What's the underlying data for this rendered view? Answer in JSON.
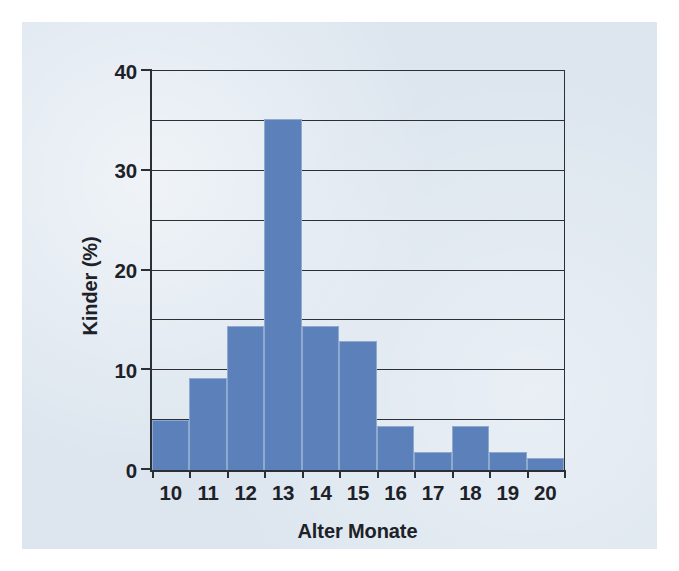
{
  "figure": {
    "background_color": "#ffffff",
    "panel_color": "#dde6ef",
    "bar_fill_color": "#5c80b9",
    "bar_edge_color": "#8fa9d0",
    "axis_color": "#2b2f36"
  },
  "chart_data": {
    "type": "bar",
    "title": "",
    "subtitle": "",
    "xlabel": "Alter Monate",
    "ylabel": "Kinder (%)",
    "categories": [
      "10",
      "11",
      "12",
      "13",
      "14",
      "15",
      "16",
      "17",
      "18",
      "19",
      "20"
    ],
    "values": [
      5.0,
      9.2,
      14.4,
      35.2,
      14.4,
      12.9,
      4.4,
      1.8,
      4.4,
      1.8,
      1.2
    ],
    "series": [
      {
        "name": "Kinder (%)",
        "values": [
          5.0,
          9.2,
          14.4,
          35.2,
          14.4,
          12.9,
          4.4,
          1.8,
          4.4,
          1.8,
          1.2
        ]
      }
    ],
    "xlim": [
      9.5,
      20.5
    ],
    "ylim": [
      0,
      40
    ],
    "ytick_labels": [
      "0",
      "10",
      "20",
      "30",
      "40"
    ],
    "ytick_values": [
      0,
      10,
      20,
      30,
      40
    ],
    "gridline_values": [
      0,
      5,
      10,
      15,
      20,
      25,
      30,
      35,
      40
    ],
    "grid": true,
    "grid_axis": "y",
    "legend": false,
    "legend_position": "none",
    "annotations": []
  }
}
